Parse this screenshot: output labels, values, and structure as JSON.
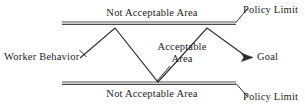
{
  "diagram": {
    "colors": {
      "stroke": "#2b2b2b",
      "rail_dark": "#4a4a4a",
      "rail_light": "#9a9a9a",
      "text": "#1c1c1c",
      "background": "#ffffff"
    },
    "labels": {
      "not_acceptable_top": "Not Acceptable Area",
      "not_acceptable_bottom": "Not Acceptable Area",
      "worker_behavior": "Worker Behavior",
      "acceptable_line1": "Acceptable",
      "acceptable_line2": "Area",
      "goal": "Goal",
      "policy_limit_top": "Policy Limit",
      "policy_limit_bottom": "Policy Limit"
    },
    "geometry": {
      "upper_rail": {
        "x1": 62,
        "y1": 23,
        "x2": 236,
        "y2": 23
      },
      "lower_rail": {
        "x1": 62,
        "y1": 83,
        "x2": 236,
        "y2": 83
      },
      "behavior_path": "M 80,58 L 115,28 L 158,82 L 207,28 L 249,57",
      "goal_arrow_tip": {
        "x": 252,
        "y": 57
      },
      "leader_policy_top": {
        "x1": 236,
        "y1": 22,
        "x2": 248,
        "y2": 9
      },
      "leader_policy_bottom": {
        "x1": 236,
        "y1": 84,
        "x2": 248,
        "y2": 96
      },
      "leader_worker": {
        "x1": 79,
        "y1": 57,
        "x2": 86,
        "y2": 50
      },
      "leader_acceptable": {
        "x1": 158,
        "y1": 80,
        "x2": 170,
        "y2": 66
      }
    }
  }
}
